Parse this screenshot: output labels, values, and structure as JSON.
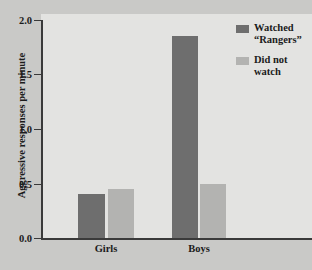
{
  "chart_data": {
    "type": "bar",
    "title": "",
    "xlabel": "",
    "ylabel": "Aggressive responses per minute",
    "categories": [
      "Girls",
      "Boys"
    ],
    "ylim": [
      0.0,
      2.0
    ],
    "yticks": [
      "0.0",
      "0.5",
      "1.0",
      "1.5",
      "2.0"
    ],
    "ytick_values": [
      0.0,
      0.5,
      1.0,
      1.5,
      2.0
    ],
    "grid": false,
    "legend_position": "top-right",
    "series": [
      {
        "name": "Watched “Rangers”",
        "name_lines": "Watched\n“Rangers”",
        "color": "#6e6e6e",
        "values": [
          0.4,
          1.85
        ]
      },
      {
        "name": "Did not watch",
        "name_lines": "Did not\nwatch",
        "color": "#b3b3b1",
        "values": [
          0.45,
          0.5
        ]
      }
    ]
  },
  "style": {
    "figure_background": "#c9c9c7",
    "plot_background": "#e3e3e1",
    "axis_color": "#3a3a3a",
    "text_color": "#1b1b1b"
  }
}
